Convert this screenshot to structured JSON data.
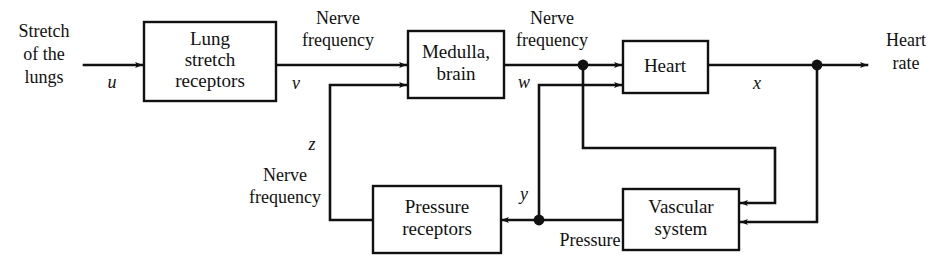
{
  "diagram": {
    "background_color": "#ffffff",
    "line_color": "#111111",
    "blocks": [
      {
        "id": "lung",
        "label_line1": "Lung",
        "label_line2": "stretch",
        "label_line3": "receptors"
      },
      {
        "id": "medulla",
        "label_line1": "Medulla,",
        "label_line2": "brain"
      },
      {
        "id": "heart",
        "label_line1": "Heart"
      },
      {
        "id": "pressure",
        "label_line1": "Pressure",
        "label_line2": "receptors"
      },
      {
        "id": "vascular",
        "label_line1": "Vascular",
        "label_line2": "system"
      }
    ],
    "signals": {
      "input_line1": "Stretch",
      "input_line2": "of the",
      "input_line3": "lungs",
      "nerve_freq_1_line1": "Nerve",
      "nerve_freq_1_line2": "frequency",
      "nerve_freq_2_line1": "Nerve",
      "nerve_freq_2_line2": "frequency",
      "nerve_freq_3_line1": "Nerve",
      "nerve_freq_3_line2": "frequency",
      "pressure_label": "Pressure",
      "output_line1": "Heart",
      "output_line2": "rate"
    },
    "variables": {
      "u": "u",
      "v": "v",
      "w": "w",
      "x": "x",
      "y": "y",
      "z": "z"
    }
  }
}
